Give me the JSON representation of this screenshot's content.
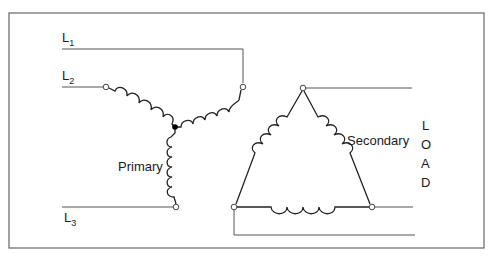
{
  "diagram": {
    "type": "wye-delta transformer connection",
    "lines": {
      "l1": {
        "letter": "L",
        "sub": "1"
      },
      "l2": {
        "letter": "L",
        "sub": "2"
      },
      "l3": {
        "letter": "L",
        "sub": "3"
      }
    },
    "labels": {
      "primary": "Primary",
      "secondary": "Secondary"
    },
    "load": {
      "letters": [
        "L",
        "O",
        "A",
        "D"
      ]
    },
    "colors": {
      "line": "#555555",
      "coil": "#222222",
      "frame": "#666666",
      "background": "#ffffff"
    }
  }
}
